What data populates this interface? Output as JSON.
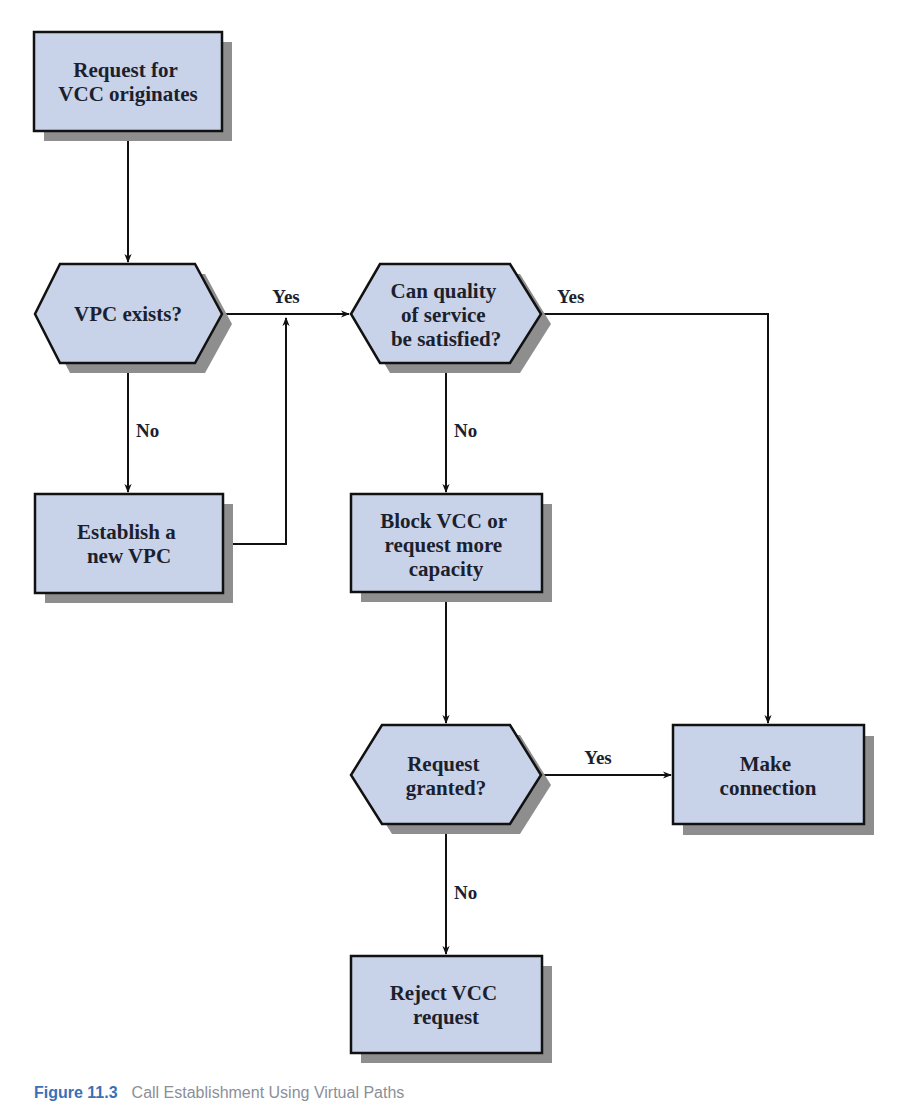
{
  "colors": {
    "node_fill": "#c8d2e8",
    "node_stroke": "#111111",
    "shadow": "#8e8e8e",
    "line": "#111111",
    "caption_number": "#3b6fb6"
  },
  "nodes": {
    "start": {
      "type": "process",
      "lines": [
        "Request for",
        "VCC originates"
      ]
    },
    "vpc_exists": {
      "type": "decision",
      "lines": [
        "VPC exists?"
      ]
    },
    "qos": {
      "type": "decision",
      "lines": [
        "Can quality",
        "of service",
        "be satisfied?"
      ]
    },
    "establish_vpc": {
      "type": "process",
      "lines": [
        "Establish a",
        "new VPC"
      ]
    },
    "block_vcc": {
      "type": "process",
      "lines": [
        "Block VCC or",
        "request more",
        "capacity"
      ]
    },
    "request_granted": {
      "type": "decision",
      "lines": [
        "Request",
        "granted?"
      ]
    },
    "make_connection": {
      "type": "process",
      "lines": [
        "Make",
        "connection"
      ]
    },
    "reject_vcc": {
      "type": "process",
      "lines": [
        "Reject VCC",
        "request"
      ]
    }
  },
  "edges": {
    "vpc_yes": "Yes",
    "vpc_no": "No",
    "qos_yes": "Yes",
    "qos_no": "No",
    "granted_yes": "Yes",
    "granted_no": "No"
  },
  "caption": {
    "number": "Figure 11.3",
    "text": "Call Establishment Using Virtual Paths"
  }
}
